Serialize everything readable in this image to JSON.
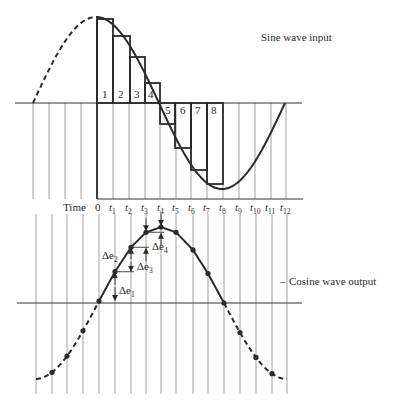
{
  "labels": {
    "sine_title": "Sine wave input",
    "cosine_title": "Cosine wave output",
    "cosine_dash": "–",
    "time_label": "Time",
    "time_zero": "0",
    "time_prefix": "t",
    "time_ticks": [
      "1",
      "2",
      "3",
      "4",
      "5",
      "6",
      "7",
      "8",
      "9",
      "10",
      "11",
      "12"
    ],
    "box_numbers": [
      "1",
      "2",
      "3",
      "4",
      "5",
      "6",
      "7",
      "8"
    ],
    "delta_main": "Δe",
    "delta_subs": [
      "1",
      "2",
      "3",
      "4"
    ]
  },
  "colors": {
    "ink": "#2a2a2a",
    "grid": "#8a8a8a",
    "background": "#ffffff"
  },
  "diagram": {
    "sine": {
      "axis_y": 103,
      "axis_x": [
        15,
        302
      ],
      "zero_x": 33,
      "period_px": 252,
      "amplitude_px": 86,
      "dashed_until_x": 97,
      "end_x": 285,
      "grid_x": [
        33,
        49,
        65,
        81,
        97,
        113,
        129,
        145,
        160,
        176,
        191,
        207,
        223,
        239,
        255,
        271,
        286
      ],
      "grid_y": [
        103,
        199
      ],
      "box_edges_x": [
        97,
        113,
        130,
        145,
        160,
        175,
        191,
        207,
        223
      ],
      "box_levels_y": [
        19,
        36,
        57,
        83,
        124,
        148,
        170,
        184
      ],
      "time_axis": {
        "y": 199,
        "x": [
          97,
          303
        ]
      }
    },
    "cosine": {
      "axis_y": 303,
      "axis_x": [
        17,
        302
      ],
      "peak_x": 161,
      "period_px": 252,
      "amplitude_px": 76,
      "solid_range_x": [
        99,
        224
      ],
      "dashed_range_x": [
        [
          36,
          99
        ],
        [
          224,
          287
        ]
      ],
      "grid_x": [
        36,
        52,
        67,
        83,
        99,
        115,
        131,
        146,
        161,
        176,
        193,
        208,
        224,
        240,
        256,
        272,
        287
      ],
      "grid_y": [
        214,
        394
      ],
      "dots_x": [
        52,
        67,
        83,
        99,
        115,
        131,
        146,
        161,
        176,
        193,
        208,
        224,
        240,
        256,
        272
      ]
    },
    "time_label_positions_x": [
      63,
      98,
      113,
      129,
      145,
      161,
      176,
      192,
      207,
      222,
      238,
      254,
      270,
      286
    ],
    "time_label_y": 211
  }
}
